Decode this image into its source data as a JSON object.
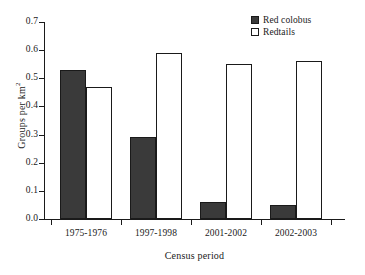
{
  "chart_data": {
    "type": "bar",
    "title": "",
    "subtitle": "",
    "xlabel": "Census period",
    "ylabel": "Groups per km²",
    "ylabel_base": "Groups per km",
    "ylabel_sup": "2",
    "categories": [
      "1975-1976",
      "1997-1998",
      "2001-2002",
      "2002-2003"
    ],
    "series": [
      {
        "name": "Red colobus",
        "values": [
          0.53,
          0.29,
          0.06,
          0.05
        ],
        "fill": "#3a3a3a",
        "edge": "#1a1a1a",
        "style": "filled"
      },
      {
        "name": "Redtails",
        "values": [
          0.47,
          0.59,
          0.55,
          0.56
        ],
        "fill": "#ffffff",
        "edge": "#1a1a1a",
        "style": "open"
      }
    ],
    "ylim": [
      0.0,
      0.7
    ],
    "ytick_values": [
      0.0,
      0.1,
      0.2,
      0.3,
      0.4,
      0.5,
      0.6,
      0.7
    ],
    "ytick_labels": [
      "0.0",
      "0.1",
      "0.2",
      "0.3",
      "0.4",
      "0.5",
      "0.6",
      "0.7"
    ],
    "grid": false,
    "legend_position": "top-right",
    "spines": "left-bottom"
  },
  "legend": {
    "entries": [
      {
        "label": "Red colobus",
        "style": "filled"
      },
      {
        "label": "Redtails",
        "style": "open"
      }
    ]
  }
}
